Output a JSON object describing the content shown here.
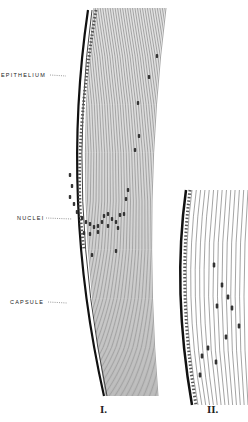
{
  "figure": {
    "panels": [
      {
        "id": "I",
        "label": "I."
      },
      {
        "id": "II",
        "label": "II."
      }
    ],
    "annotations": [
      {
        "id": "epithelium",
        "text": "EPITHELIUM"
      },
      {
        "id": "nuclei",
        "text": "NUCLEI"
      },
      {
        "id": "capsule",
        "text": "CAPSULE"
      }
    ],
    "colors": {
      "ink": "#222222",
      "background": "#ffffff"
    }
  }
}
